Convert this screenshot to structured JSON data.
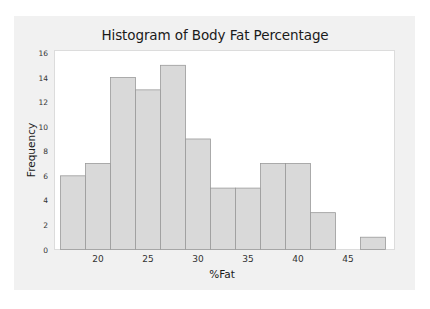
{
  "chart_data": {
    "type": "bar",
    "title": "Histogram of Body Fat Percentage",
    "xlabel": "%Fat",
    "ylabel": "Frequency",
    "bin_width": 2.5,
    "bin_centers": [
      17.5,
      20,
      22.5,
      25,
      27.5,
      30,
      32.5,
      35,
      37.5,
      40,
      42.5,
      45,
      47.5
    ],
    "bin_edges": [
      16.25,
      18.75,
      21.25,
      23.75,
      26.25,
      28.75,
      31.25,
      33.75,
      36.25,
      38.75,
      41.25,
      43.75,
      46.25,
      48.75
    ],
    "values": [
      6,
      7,
      14,
      13,
      15,
      9,
      5,
      5,
      7,
      7,
      3,
      0,
      1
    ],
    "xticks": [
      20,
      25,
      30,
      35,
      40,
      45
    ],
    "yticks": [
      0,
      2,
      4,
      6,
      8,
      10,
      12,
      14,
      16
    ],
    "ylim": [
      0,
      16
    ],
    "xlim": [
      15,
      49.5
    ],
    "grid": false,
    "legend": null,
    "colors": {
      "bar_fill": "#d9d9d9",
      "bar_edge": "#9a9a9a",
      "plot_bg": "#ffffff",
      "panel_bg": "#f1f1f1"
    }
  },
  "labels": {
    "title": "Histogram of Body Fat Percentage",
    "xlabel": "%Fat",
    "ylabel": "Frequency"
  }
}
